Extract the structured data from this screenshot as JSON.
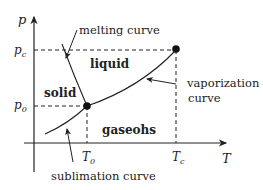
{
  "diagram": {
    "type": "phase-diagram",
    "axes": {
      "x_label": "T",
      "y_label": "p"
    },
    "ticks": {
      "p_c": "p",
      "p_c_sub": "c",
      "p_0": "p",
      "p_0_sub": "0",
      "T_0": "T",
      "T_0_sub": "0",
      "T_c": "T",
      "T_c_sub": "c"
    },
    "regions": {
      "solid": "solid",
      "liquid": "liquid",
      "gas": "gaseohs"
    },
    "curve_labels": {
      "melting": "melting curve",
      "vaporization_line1": "vaporization",
      "vaporization_line2": "curve",
      "sublimation": "sublimation curve"
    },
    "points": {
      "triple_point": "triple point (T0, p0)",
      "critical_point": "critical point (Tc, pc)"
    },
    "colors": {
      "ink": "#222222",
      "background": "#ffffff"
    }
  }
}
